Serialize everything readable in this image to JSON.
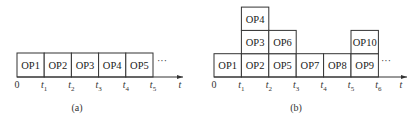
{
  "diagrams": [
    {
      "id": "a",
      "caption": "(a)",
      "cells": [
        {
          "label": "OP1",
          "col": 0,
          "row": 0
        },
        {
          "label": "OP2",
          "col": 1,
          "row": 0
        },
        {
          "label": "OP3",
          "col": 2,
          "row": 0
        },
        {
          "label": "OP4",
          "col": 3,
          "row": 0
        },
        {
          "label": "OP5",
          "col": 4,
          "row": 0
        }
      ],
      "ellipsis": "···",
      "ticks": [
        {
          "base": "0",
          "sub": ""
        },
        {
          "base": "t",
          "sub": "1"
        },
        {
          "base": "t",
          "sub": "2"
        },
        {
          "base": "t",
          "sub": "3"
        },
        {
          "base": "t",
          "sub": "4"
        },
        {
          "base": "t",
          "sub": "5"
        }
      ],
      "axis_label": "t"
    },
    {
      "id": "b",
      "caption": "(b)",
      "cells": [
        {
          "label": "OP1",
          "col": 0,
          "row": 0
        },
        {
          "label": "OP2",
          "col": 1,
          "row": 0
        },
        {
          "label": "OP3",
          "col": 1,
          "row": 1
        },
        {
          "label": "OP4",
          "col": 1,
          "row": 2
        },
        {
          "label": "OP5",
          "col": 2,
          "row": 0
        },
        {
          "label": "OP6",
          "col": 2,
          "row": 1
        },
        {
          "label": "OP7",
          "col": 3,
          "row": 0
        },
        {
          "label": "OP8",
          "col": 4,
          "row": 0
        },
        {
          "label": "OP9",
          "col": 5,
          "row": 0
        },
        {
          "label": "OP10",
          "col": 5,
          "row": 1
        }
      ],
      "ellipsis": "···",
      "ticks": [
        {
          "base": "0",
          "sub": ""
        },
        {
          "base": "t",
          "sub": "1"
        },
        {
          "base": "t",
          "sub": "2"
        },
        {
          "base": "t",
          "sub": "3"
        },
        {
          "base": "t",
          "sub": "4"
        },
        {
          "base": "t",
          "sub": "5"
        },
        {
          "base": "t",
          "sub": "6"
        }
      ],
      "axis_label": "t"
    }
  ]
}
